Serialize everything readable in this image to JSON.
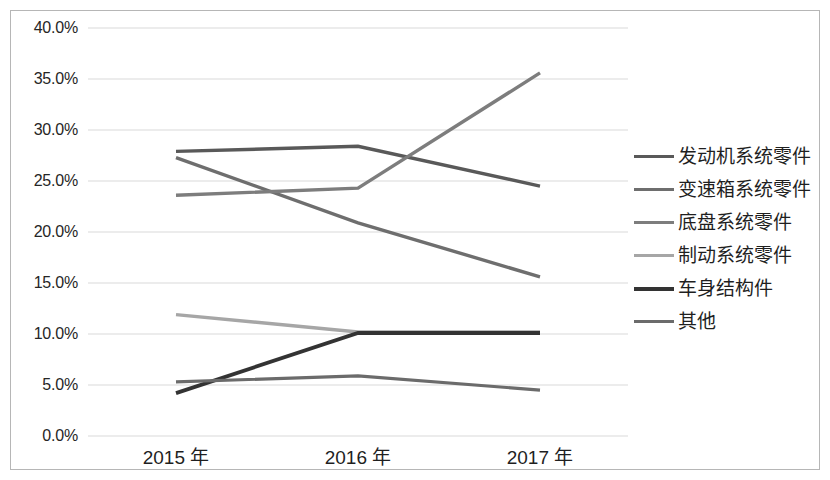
{
  "chart_data": {
    "type": "line",
    "title": "",
    "xlabel": "",
    "ylabel": "",
    "categories": [
      "2015 年",
      "2016 年",
      "2017 年"
    ],
    "ylim": [
      0.0,
      40.0
    ],
    "ytick_labels": [
      "40.0%",
      "35.0%",
      "30.0%",
      "25.0%",
      "20.0%",
      "15.0%",
      "10.0%",
      "5.0%",
      "0.0%"
    ],
    "ytick_values": [
      40.0,
      35.0,
      30.0,
      25.0,
      20.0,
      15.0,
      10.0,
      5.0,
      0.0
    ],
    "grid": "horizontal",
    "legend_position": "right",
    "value_suffix": "%",
    "series": [
      {
        "name": "发动机系统零件",
        "color": "#595959",
        "width": 3.4,
        "values": [
          27.9,
          28.4,
          24.5
        ]
      },
      {
        "name": "变速箱系统零件",
        "color": "#6e6e6e",
        "width": 3.4,
        "values": [
          27.3,
          20.9,
          15.6
        ]
      },
      {
        "name": "底盘系统零件",
        "color": "#7d7d7d",
        "width": 3.4,
        "values": [
          23.6,
          24.3,
          35.6
        ]
      },
      {
        "name": "制动系统零件",
        "color": "#a6a6a6",
        "width": 3.4,
        "values": [
          11.9,
          10.2,
          10.2
        ]
      },
      {
        "name": "车身结构件",
        "color": "#333333",
        "width": 3.8,
        "values": [
          4.2,
          10.1,
          10.1
        ]
      },
      {
        "name": "其他",
        "color": "#6b6b6b",
        "width": 3.2,
        "values": [
          5.3,
          5.9,
          4.5
        ]
      }
    ]
  },
  "style": {
    "frame_border_color": "#b6b6b6",
    "gridline_color": "#d9d9d9",
    "background": "#ffffff",
    "axis_text_color": "#262626"
  }
}
